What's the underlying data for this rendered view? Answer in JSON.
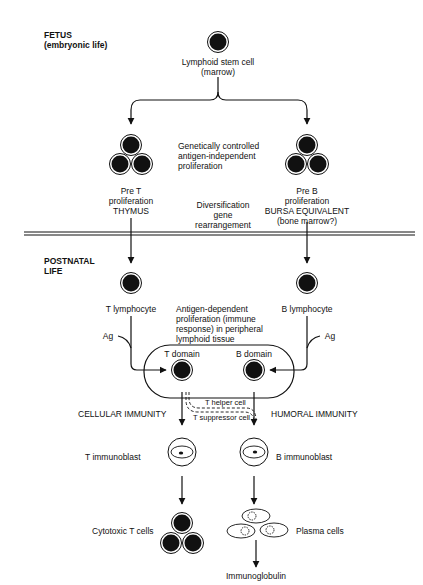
{
  "sections": {
    "fetus": {
      "title": "FETUS",
      "subtitle": "(embryonic life)"
    },
    "postnatal": {
      "title_line1": "POSTNATAL",
      "title_line2": "LIFE"
    }
  },
  "nodes": {
    "stem_cell": {
      "line1": "Lymphoid stem cell",
      "line2": "(marrow)"
    },
    "pre_t": {
      "line1": "Pre T",
      "line2": "proliferation",
      "line3": "THYMUS"
    },
    "pre_b": {
      "line1": "Pre B",
      "line2": "proliferation",
      "line3": "BURSA EQUIVALENT",
      "line4": "(bone marrow?)"
    },
    "genetic_note": {
      "line1": "Genetically controlled",
      "line2": "antigen-independent",
      "line3": "proliferation"
    },
    "diversification_note": {
      "line1": "Diversification",
      "line2": "gene",
      "line3": "rearrangement"
    },
    "t_lymphocyte": "T lymphocyte",
    "b_lymphocyte": "B lymphocyte",
    "antigen_note": {
      "line1": "Antigen-dependent",
      "line2": "proliferation (immune",
      "line3": "response) in peripheral",
      "line4": "lymphoid tissue"
    },
    "ag_left": "Ag",
    "ag_right": "Ag",
    "t_domain": "T domain",
    "b_domain": "B domain",
    "t_helper": "T helper cell",
    "t_suppressor": "T suppressor cell",
    "cellular_immunity": "CELLULAR IMMUNITY",
    "humoral_immunity": "HUMORAL IMMUNITY",
    "t_immunoblast": "T immunoblast",
    "b_immunoblast": "B immunoblast",
    "cytotoxic_t": "Cytotoxic T cells",
    "plasma_cells": "Plasma cells",
    "immunoglobulin": "Immunoglobulin"
  }
}
